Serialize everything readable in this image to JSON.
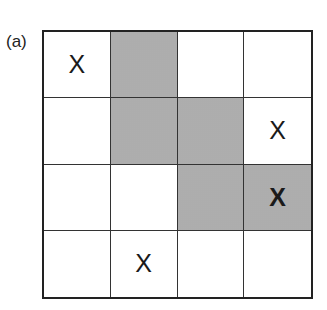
{
  "panel_label": "(a)",
  "grid": {
    "rows": 4,
    "cols": 4,
    "shade_color": "#b9b9b9",
    "line_color": "#222222",
    "cells": [
      [
        {
          "mark": "X",
          "shaded": false
        },
        {
          "mark": "",
          "shaded": true
        },
        {
          "mark": "",
          "shaded": false
        },
        {
          "mark": "",
          "shaded": false
        }
      ],
      [
        {
          "mark": "",
          "shaded": false
        },
        {
          "mark": "",
          "shaded": true
        },
        {
          "mark": "",
          "shaded": true
        },
        {
          "mark": "X",
          "shaded": false
        }
      ],
      [
        {
          "mark": "",
          "shaded": false
        },
        {
          "mark": "",
          "shaded": false
        },
        {
          "mark": "",
          "shaded": true
        },
        {
          "mark": "X",
          "shaded": true
        }
      ],
      [
        {
          "mark": "",
          "shaded": false
        },
        {
          "mark": "X",
          "shaded": false
        },
        {
          "mark": "",
          "shaded": false
        },
        {
          "mark": "",
          "shaded": false
        }
      ]
    ]
  }
}
